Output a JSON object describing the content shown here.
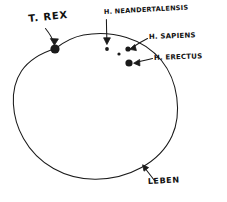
{
  "diagram": {
    "background_color": "#ffffff",
    "ink_color": "#1a1a1a",
    "labels": {
      "trex": "T. REX",
      "neandertalensis": "H. NEANDERTALENSIS",
      "sapiens": "H. SAPIENS",
      "erectus": "H. ERECTUS",
      "leben": "LEBEN"
    },
    "shapes": {
      "main_circle_name": "leben-circle"
    },
    "points": [
      {
        "name": "trex-dot",
        "label": "T. REX",
        "cx": 55,
        "cy": 49,
        "r": 4.6
      },
      {
        "name": "neandertalensis-dot",
        "label": "H. NEANDERTALENSIS",
        "cx": 107,
        "cy": 49,
        "r": 1.9
      },
      {
        "name": "unlabeled-dot",
        "label": "",
        "cx": 119,
        "cy": 54,
        "r": 1.6
      },
      {
        "name": "sapiens-dot",
        "label": "H. SAPIENS",
        "cx": 128,
        "cy": 49,
        "r": 2.6
      },
      {
        "name": "erectus-dot",
        "label": "H. ERECTUS",
        "cx": 129,
        "cy": 63,
        "r": 3.6
      }
    ],
    "annotations": [
      {
        "name": "trex-arrow",
        "from_label": "T. REX",
        "to_point": "trex-dot"
      },
      {
        "name": "neandertalensis-arrow",
        "from_label": "H. NEANDERTALENSIS",
        "to_point": "neandertalensis-dot"
      },
      {
        "name": "sapiens-arrow",
        "from_label": "H. SAPIENS",
        "to_point": "sapiens-dot"
      },
      {
        "name": "erectus-arrow",
        "from_label": "H. ERECTUS",
        "to_point": "erectus-dot"
      },
      {
        "name": "leben-arrow",
        "from_label": "LEBEN",
        "to_point": "leben-circle"
      }
    ]
  }
}
